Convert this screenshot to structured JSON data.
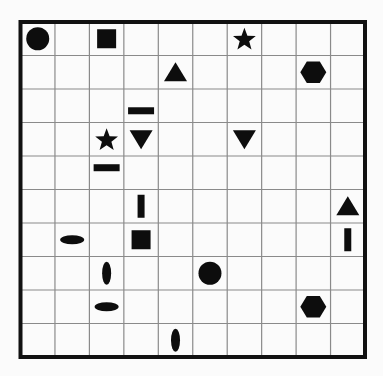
{
  "board": {
    "rows": 10,
    "cols": 10,
    "colors": {
      "background": "#fbfbfb",
      "grid_line": "#8a8a8a",
      "border": "#111111",
      "shape_fill": "#0d0d0d"
    },
    "shapes": [
      {
        "type": "circle",
        "row": 0,
        "col": 0,
        "align": "center"
      },
      {
        "type": "square",
        "row": 0,
        "col": 2,
        "align": "center"
      },
      {
        "type": "star",
        "row": 0,
        "col": 6,
        "align": "center"
      },
      {
        "type": "triangle-up",
        "row": 1,
        "col": 4,
        "align": "center"
      },
      {
        "type": "hexagon",
        "row": 1,
        "col": 8,
        "align": "center"
      },
      {
        "type": "bar-horizontal",
        "row": 2,
        "col": 3,
        "align": "bottom"
      },
      {
        "type": "star",
        "row": 3,
        "col": 2,
        "align": "center"
      },
      {
        "type": "triangle-down",
        "row": 3,
        "col": 3,
        "align": "center"
      },
      {
        "type": "triangle-down",
        "row": 3,
        "col": 6,
        "align": "center"
      },
      {
        "type": "bar-horizontal",
        "row": 4,
        "col": 2,
        "align": "top"
      },
      {
        "type": "bar-vertical",
        "row": 5,
        "col": 3,
        "align": "center"
      },
      {
        "type": "triangle-up",
        "row": 5,
        "col": 9,
        "align": "center"
      },
      {
        "type": "ellipse-horizontal",
        "row": 6,
        "col": 1,
        "align": "center"
      },
      {
        "type": "square",
        "row": 6,
        "col": 3,
        "align": "center"
      },
      {
        "type": "bar-vertical",
        "row": 6,
        "col": 9,
        "align": "center"
      },
      {
        "type": "ellipse-vertical",
        "row": 7,
        "col": 2,
        "align": "center"
      },
      {
        "type": "circle",
        "row": 7,
        "col": 5,
        "align": "center"
      },
      {
        "type": "ellipse-horizontal",
        "row": 8,
        "col": 2,
        "align": "center"
      },
      {
        "type": "hexagon",
        "row": 8,
        "col": 8,
        "align": "center"
      },
      {
        "type": "ellipse-vertical",
        "row": 9,
        "col": 4,
        "align": "center"
      }
    ]
  }
}
